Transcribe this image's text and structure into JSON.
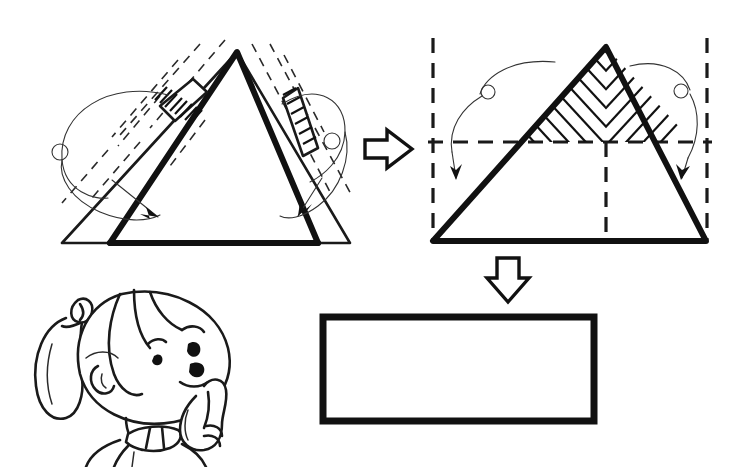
{
  "page": {
    "title": "Triangle to Rectangle Area Transformation",
    "background_color": "#ffffff",
    "ink_color": "#111111",
    "width": 747,
    "height": 473
  },
  "figures": {
    "left_triangle": {
      "name": "tilted-triangle-with-cut-flaps",
      "label": "",
      "apex": [
        237,
        52
      ],
      "base_left": [
        62,
        243
      ],
      "base_right": [
        350,
        243
      ],
      "inner_left": [
        110,
        243
      ],
      "inner_right": [
        318,
        243
      ],
      "description": "Triangle with two side flaps being folded inward, shown with dashed construction lines",
      "dashed_guides": 10,
      "fold_arrows": 2
    },
    "right_triangle": {
      "name": "triangle-with-hatched-top-half",
      "label": "",
      "apex": [
        606,
        47
      ],
      "base_left": [
        433,
        241
      ],
      "base_right": [
        706,
        241
      ],
      "midline_y": 142,
      "midline_x": 606,
      "description": "Upright triangle, upper half hatched with herringbone pattern, dashed bounding box and midlines",
      "fold_arrows": 2
    },
    "result_rectangle": {
      "name": "result-rectangle",
      "label": "",
      "x": 320,
      "y": 314,
      "width": 271,
      "height": 104,
      "border_width": 7,
      "fill": "#ffffff"
    }
  },
  "arrows": {
    "transform_right": {
      "name": "block-arrow-right",
      "direction": "right",
      "x": 365,
      "y": 130,
      "width": 46,
      "height": 44
    },
    "transform_down": {
      "name": "block-arrow-down",
      "direction": "down",
      "x": 488,
      "y": 256,
      "width": 40,
      "height": 42
    }
  },
  "character": {
    "name": "thinking-girl",
    "pose": "hand-to-chin thinking",
    "expression": "puzzled",
    "features": [
      "ponytail",
      "hair-tie",
      "eyebrows",
      "eyes",
      "open-mouth",
      "collar",
      "raised-index-finger"
    ],
    "bounds": {
      "x": 30,
      "y": 288,
      "width": 215,
      "height": 160
    }
  },
  "annotations": {
    "text_items": []
  }
}
